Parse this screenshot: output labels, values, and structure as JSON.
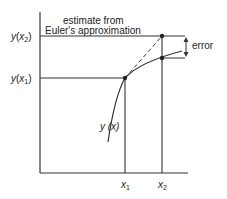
{
  "diagram": {
    "title_line1": "estimate from",
    "title_line2": "Euler's approximation",
    "y_labels": {
      "y_x2": {
        "func": "y",
        "open": "(",
        "var": "x",
        "sub": "2",
        "close": ")"
      },
      "y_x1": {
        "func": "y",
        "open": "(",
        "var": "x",
        "sub": "1",
        "close": ")"
      }
    },
    "x_labels": {
      "x1": {
        "var": "x",
        "sub": "1"
      },
      "x2": {
        "var": "x",
        "sub": "2"
      }
    },
    "curve_label": "y (x)",
    "error_label": "error",
    "colors": {
      "line": "#333333",
      "background": "#ffffff"
    }
  }
}
